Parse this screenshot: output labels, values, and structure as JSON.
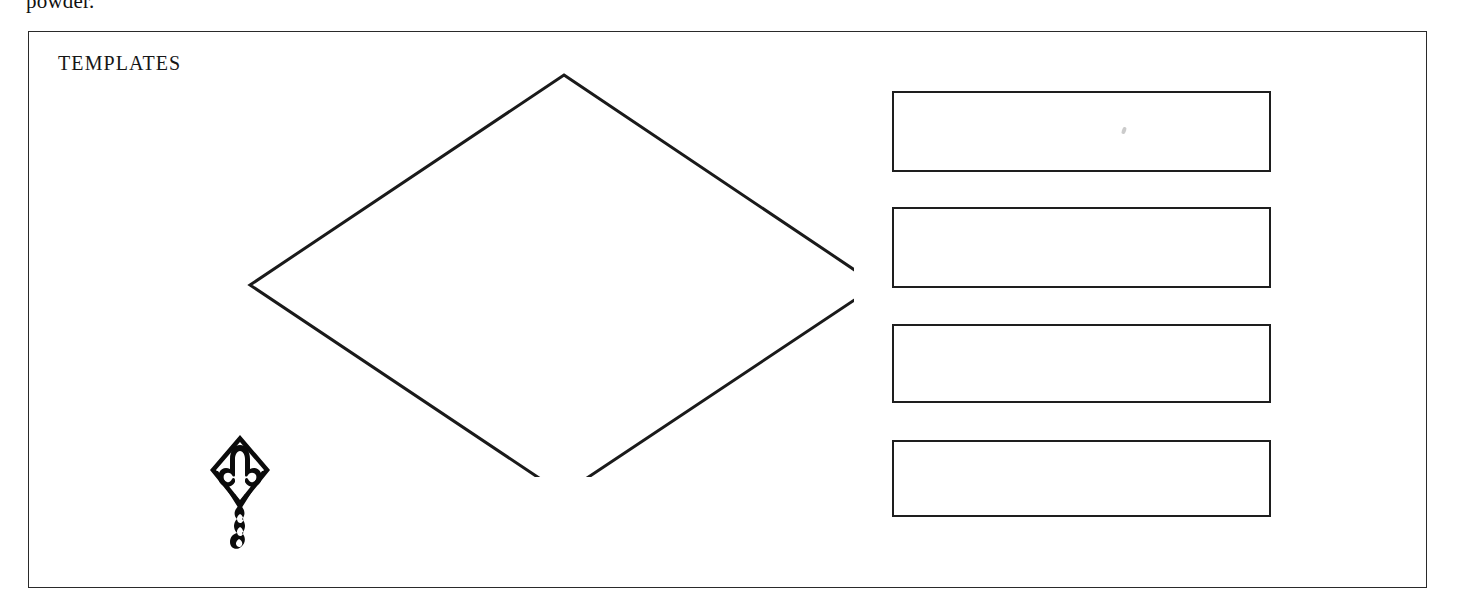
{
  "page": {
    "running_text_fragment": "powder.",
    "background_color": "#ffffff",
    "ink_color": "#1a1a1a"
  },
  "template_frame": {
    "title": "TEMPLATES",
    "border_color": "#2a2a2a",
    "fill_color": "#ffffff"
  },
  "templates": {
    "diamond": {
      "name": "diamond-template",
      "shape": "diamond",
      "stroke_color": "#1a1a1a",
      "vertices": {
        "top": [
          350,
          38
        ],
        "right": [
          663,
          248
        ],
        "bottom": [
          349,
          457
        ],
        "left": [
          36,
          248
        ]
      }
    },
    "strips": [
      {
        "name": "strip-template-1",
        "shape": "rectangle",
        "stroke_color": "#1e1e1e"
      },
      {
        "name": "strip-template-2",
        "shape": "rectangle",
        "stroke_color": "#1e1e1e"
      },
      {
        "name": "strip-template-3",
        "shape": "rectangle",
        "stroke_color": "#1e1e1e"
      },
      {
        "name": "strip-template-4",
        "shape": "rectangle",
        "stroke_color": "#1e1e1e"
      }
    ]
  },
  "illustration": {
    "name": "kite-illustration",
    "description": "diamond kite with rocket motif and looped bow tail",
    "ink_color": "#0b0b0b"
  }
}
